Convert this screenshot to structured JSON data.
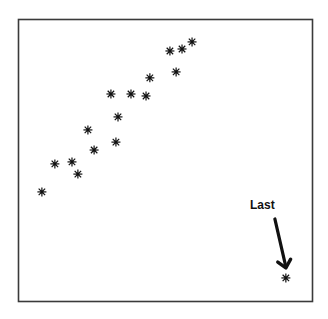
{
  "chart_data": {
    "type": "scatter",
    "title": "",
    "xlabel": "",
    "ylabel": "",
    "xlim": [
      0,
      100
    ],
    "ylim": [
      0,
      100
    ],
    "grid": false,
    "axes_ticks": false,
    "frame": true,
    "marker": "asterisk",
    "colors": {
      "marker": "#111111",
      "frame": "#3a3a3a",
      "background": "#ffffff",
      "annotation": "#111111"
    },
    "series": [
      {
        "name": "points",
        "points": [
          {
            "x": 8.1,
            "y": 38.9
          },
          {
            "x": 12.5,
            "y": 48.8
          },
          {
            "x": 18.3,
            "y": 49.5
          },
          {
            "x": 20.3,
            "y": 45.2
          },
          {
            "x": 23.7,
            "y": 60.8
          },
          {
            "x": 25.8,
            "y": 53.7
          },
          {
            "x": 33.2,
            "y": 56.5
          },
          {
            "x": 33.9,
            "y": 65.4
          },
          {
            "x": 31.5,
            "y": 73.5
          },
          {
            "x": 38.3,
            "y": 73.5
          },
          {
            "x": 43.4,
            "y": 72.8
          },
          {
            "x": 44.7,
            "y": 79.2
          },
          {
            "x": 53.6,
            "y": 81.3
          },
          {
            "x": 51.5,
            "y": 88.7
          },
          {
            "x": 55.6,
            "y": 89.4
          },
          {
            "x": 59.0,
            "y": 91.9
          },
          {
            "x": 90.8,
            "y": 8.5
          }
        ]
      }
    ],
    "annotations": [
      {
        "text": "Last",
        "target_point_index": 16,
        "arrow": true
      }
    ]
  }
}
